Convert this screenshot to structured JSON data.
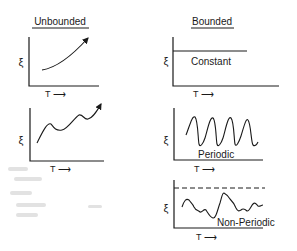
{
  "columns": [
    {
      "heading": "Unbounded",
      "panels": [
        {
          "id": "unbounded-monotonic",
          "y_label": "ξ",
          "x_label": "T ⟶",
          "curve_label": ""
        },
        {
          "id": "unbounded-oscillating",
          "y_label": "ξ",
          "x_label": "T ⟶",
          "curve_label": ""
        }
      ]
    },
    {
      "heading": "Bounded",
      "panels": [
        {
          "id": "bounded-constant",
          "y_label": "ξ",
          "x_label": "T ⟶",
          "curve_label": "Constant"
        },
        {
          "id": "bounded-periodic",
          "y_label": "ξ",
          "x_label": "T ⟶",
          "curve_label": "Periodic"
        },
        {
          "id": "bounded-non-periodic",
          "y_label": "ξ",
          "x_label": "T ⟶",
          "curve_label": "Non-Periodic"
        }
      ]
    }
  ],
  "colors": {
    "ink": "#1a1a1a",
    "background": "#ffffff",
    "bleed_through": "#d8d8d8"
  }
}
